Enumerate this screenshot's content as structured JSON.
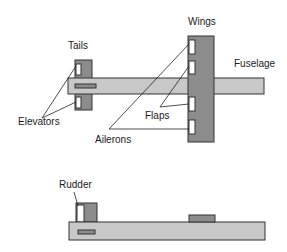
{
  "diagram": {
    "labels": {
      "tails": "Tails",
      "wings": "Wings",
      "fuselage": "Fuselage",
      "elevators": "Elevators",
      "flaps": "Flaps",
      "ailerons": "Ailerons",
      "rudder": "Rudder"
    },
    "views": [
      {
        "name": "top-view",
        "parts": [
          "Tails",
          "Wings",
          "Fuselage",
          "Elevators",
          "Flaps",
          "Ailerons"
        ]
      },
      {
        "name": "side-view",
        "parts": [
          "Rudder"
        ]
      }
    ],
    "colors": {
      "fuselage_fill": "#c8c8c8",
      "surface_fill": "#8c8c8c",
      "control_fill": "#ffffff",
      "stroke": "#333333"
    }
  }
}
